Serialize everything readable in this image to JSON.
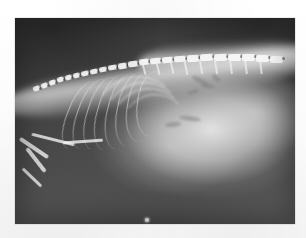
{
  "page": {
    "background_color": "#fdfdfd",
    "width": 306,
    "height": 238
  },
  "radiograph": {
    "name": "lateral-abdominal-radiograph",
    "subject": "small animal lateral projection",
    "frame": {
      "left": 15,
      "top": 18,
      "width": 280,
      "height": 206
    },
    "background_color": "#454545",
    "bright_tissue_color": "#e8e8e8",
    "bone_color": "#f8f8f8",
    "dark_field_color": "#2b2b2b",
    "anatomy": {
      "spine_label": "vertebral-column",
      "ribs_label": "rib-cage",
      "diaphragm_label": "diaphragm-liver-interface",
      "abdomen_label": "abdominal-soft-tissue",
      "forelimb_label": "forelimb-bones",
      "marker_label": "radiopaque-marker-dot"
    },
    "vertebrae": [
      {
        "x": 18,
        "y": 68,
        "w": 7,
        "h": 5,
        "r": -20
      },
      {
        "x": 26,
        "y": 65,
        "w": 7,
        "h": 5,
        "r": -20
      },
      {
        "x": 34,
        "y": 62,
        "w": 7,
        "h": 5,
        "r": -19
      },
      {
        "x": 42,
        "y": 59,
        "w": 7,
        "h": 5,
        "r": -18
      },
      {
        "x": 50,
        "y": 57,
        "w": 7,
        "h": 5,
        "r": -17
      },
      {
        "x": 58,
        "y": 55,
        "w": 7,
        "h": 5,
        "r": -16
      },
      {
        "x": 66,
        "y": 53,
        "w": 8,
        "h": 5,
        "r": -14
      },
      {
        "x": 75,
        "y": 51,
        "w": 8,
        "h": 5,
        "r": -13
      },
      {
        "x": 84,
        "y": 49,
        "w": 8,
        "h": 5,
        "r": -12
      },
      {
        "x": 93,
        "y": 47,
        "w": 9,
        "h": 5,
        "r": -10
      },
      {
        "x": 103,
        "y": 45,
        "w": 9,
        "h": 6,
        "r": -9
      },
      {
        "x": 113,
        "y": 43,
        "w": 10,
        "h": 6,
        "r": -8
      },
      {
        "x": 124,
        "y": 41,
        "w": 10,
        "h": 6,
        "r": -7
      },
      {
        "x": 135,
        "y": 40,
        "w": 11,
        "h": 6,
        "r": -6
      },
      {
        "x": 147,
        "y": 39,
        "w": 11,
        "h": 6,
        "r": -5
      },
      {
        "x": 159,
        "y": 38,
        "w": 12,
        "h": 6,
        "r": -4
      },
      {
        "x": 172,
        "y": 37,
        "w": 12,
        "h": 7,
        "r": -3
      },
      {
        "x": 185,
        "y": 36,
        "w": 13,
        "h": 7,
        "r": -3
      },
      {
        "x": 199,
        "y": 36,
        "w": 13,
        "h": 7,
        "r": -2
      },
      {
        "x": 213,
        "y": 36,
        "w": 13,
        "h": 7,
        "r": -1
      },
      {
        "x": 227,
        "y": 36,
        "w": 13,
        "h": 7,
        "r": 0
      },
      {
        "x": 241,
        "y": 37,
        "w": 13,
        "h": 7,
        "r": 1
      },
      {
        "x": 255,
        "y": 38,
        "w": 13,
        "h": 7,
        "r": 2
      }
    ],
    "spinous_processes": [
      {
        "x": 128,
        "y": 45,
        "w": 1.6,
        "h": 12,
        "r": -16
      },
      {
        "x": 142,
        "y": 44,
        "w": 1.6,
        "h": 13,
        "r": -14
      },
      {
        "x": 156,
        "y": 43,
        "w": 1.6,
        "h": 13,
        "r": -13
      },
      {
        "x": 170,
        "y": 43,
        "w": 1.8,
        "h": 14,
        "r": -12
      },
      {
        "x": 185,
        "y": 42,
        "w": 1.8,
        "h": 14,
        "r": -10
      },
      {
        "x": 200,
        "y": 42,
        "w": 1.8,
        "h": 14,
        "r": -9
      },
      {
        "x": 215,
        "y": 42,
        "w": 1.8,
        "h": 14,
        "r": -8
      },
      {
        "x": 230,
        "y": 43,
        "w": 1.8,
        "h": 13,
        "r": -7
      },
      {
        "x": 245,
        "y": 44,
        "w": 1.6,
        "h": 12,
        "r": -6
      }
    ],
    "ribs": [
      {
        "x": 52,
        "y": 62,
        "w": 30,
        "h": 72,
        "r": 22
      },
      {
        "x": 62,
        "y": 60,
        "w": 32,
        "h": 74,
        "r": 20
      },
      {
        "x": 72,
        "y": 58,
        "w": 34,
        "h": 76,
        "r": 18
      },
      {
        "x": 82,
        "y": 56,
        "w": 36,
        "h": 78,
        "r": 16
      },
      {
        "x": 92,
        "y": 55,
        "w": 38,
        "h": 78,
        "r": 14
      },
      {
        "x": 102,
        "y": 54,
        "w": 38,
        "h": 76,
        "r": 12
      },
      {
        "x": 112,
        "y": 53,
        "w": 38,
        "h": 72,
        "r": 10
      },
      {
        "x": 122,
        "y": 53,
        "w": 36,
        "h": 66,
        "r": 8
      }
    ],
    "arcs": [
      {
        "x": 78,
        "y": 58,
        "w": 90,
        "h": 100,
        "r": -8
      },
      {
        "x": 86,
        "y": 64,
        "w": 86,
        "h": 96,
        "r": -7
      },
      {
        "x": 94,
        "y": 70,
        "w": 80,
        "h": 90,
        "r": -6
      },
      {
        "x": 104,
        "y": 76,
        "w": 72,
        "h": 82,
        "r": -5
      }
    ],
    "wisps": [
      {
        "x": 176,
        "y": 60,
        "w": 18,
        "h": 5,
        "r": 28
      },
      {
        "x": 186,
        "y": 66,
        "w": 14,
        "h": 4,
        "r": 12
      },
      {
        "x": 172,
        "y": 72,
        "w": 12,
        "h": 4,
        "r": -18
      },
      {
        "x": 164,
        "y": 98,
        "w": 22,
        "h": 5,
        "r": 8
      },
      {
        "x": 150,
        "y": 104,
        "w": 16,
        "h": 5,
        "r": -6
      },
      {
        "x": 196,
        "y": 58,
        "w": 10,
        "h": 4,
        "r": 40
      }
    ],
    "bones": [
      {
        "x": 2,
        "y": 128,
        "w": 34,
        "h": 4,
        "r": 34
      },
      {
        "x": 6,
        "y": 140,
        "w": 30,
        "h": 4,
        "r": 52
      },
      {
        "x": 16,
        "y": 120,
        "w": 44,
        "h": 3,
        "r": 14
      },
      {
        "x": 4,
        "y": 158,
        "w": 26,
        "h": 3,
        "r": 44
      },
      {
        "x": 48,
        "y": 122,
        "w": 40,
        "h": 3,
        "r": -4
      }
    ],
    "marker": {
      "x": 130,
      "y": 200,
      "label": "radiopaque-marker-dot"
    }
  }
}
